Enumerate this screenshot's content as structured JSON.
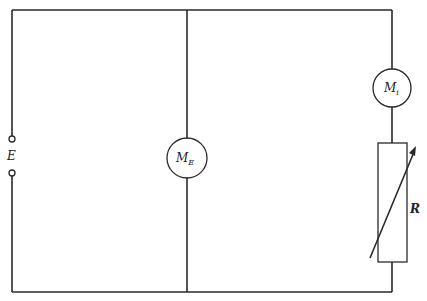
{
  "diagram": {
    "type": "circuit-schematic",
    "source": {
      "label": "E",
      "kind": "emf-terminals"
    },
    "voltmeter": {
      "label": "M",
      "subscript": "E",
      "kind": "meter"
    },
    "ammeter": {
      "label": "M",
      "subscript": "i",
      "kind": "meter"
    },
    "resistor": {
      "label": "R",
      "kind": "variable-resistor"
    },
    "wire_color": "#2a2a2a",
    "branches": [
      {
        "name": "left",
        "components": [
          "E"
        ]
      },
      {
        "name": "middle",
        "components": [
          "M_E"
        ]
      },
      {
        "name": "right",
        "components": [
          "M_i",
          "R"
        ]
      }
    ]
  }
}
